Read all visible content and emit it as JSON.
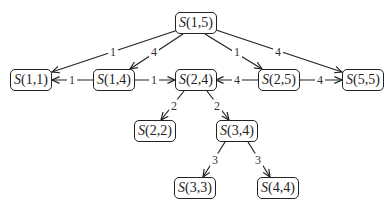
{
  "diagram": {
    "type": "tree",
    "nodes": [
      {
        "id": "S15",
        "fn": "S",
        "args": "(1,5)",
        "x": 175,
        "y": 12,
        "w": 39
      },
      {
        "id": "S11",
        "fn": "S",
        "args": "(1,1)",
        "x": 10,
        "y": 69,
        "w": 41
      },
      {
        "id": "S14",
        "fn": "S",
        "args": "(1,4)",
        "x": 93,
        "y": 69,
        "w": 41
      },
      {
        "id": "S24",
        "fn": "S",
        "args": "(2,4)",
        "x": 175,
        "y": 69,
        "w": 40
      },
      {
        "id": "S25",
        "fn": "S",
        "args": "(2,5)",
        "x": 258,
        "y": 69,
        "w": 41
      },
      {
        "id": "S55",
        "fn": "S",
        "args": "(5,5)",
        "x": 342,
        "y": 69,
        "w": 41
      },
      {
        "id": "S22",
        "fn": "S",
        "args": "(2,2)",
        "x": 134,
        "y": 120,
        "w": 41
      },
      {
        "id": "S34",
        "fn": "S",
        "args": "(3,4)",
        "x": 216,
        "y": 120,
        "w": 41
      },
      {
        "id": "S33",
        "fn": "S",
        "args": "(3,3)",
        "x": 174,
        "y": 177,
        "w": 41
      },
      {
        "id": "S44",
        "fn": "S",
        "args": "(4,4)",
        "x": 257,
        "y": 177,
        "w": 41
      }
    ],
    "edges": [
      {
        "from": "S15",
        "to": "S11",
        "label": "1",
        "x1": 178,
        "y1": 30,
        "x2": 52,
        "y2": 72,
        "lx": 113,
        "ly": 52
      },
      {
        "from": "S15",
        "to": "S14",
        "label": "4",
        "x1": 183,
        "y1": 34,
        "x2": 130,
        "y2": 69,
        "lx": 154,
        "ly": 52
      },
      {
        "from": "S15",
        "to": "S25",
        "label": "1",
        "x1": 205,
        "y1": 34,
        "x2": 262,
        "y2": 69,
        "lx": 237,
        "ly": 52
      },
      {
        "from": "S15",
        "to": "S55",
        "label": "4",
        "x1": 213,
        "y1": 29,
        "x2": 342,
        "y2": 72,
        "lx": 278,
        "ly": 52
      },
      {
        "from": "S14",
        "to": "S11",
        "label": "1",
        "x1": 93,
        "y1": 80,
        "x2": 52,
        "y2": 80,
        "lx": 72,
        "ly": 80
      },
      {
        "from": "S14",
        "to": "S24",
        "label": "1",
        "x1": 134,
        "y1": 80,
        "x2": 175,
        "y2": 80,
        "lx": 154,
        "ly": 80
      },
      {
        "from": "S25",
        "to": "S24",
        "label": "4",
        "x1": 258,
        "y1": 80,
        "x2": 216,
        "y2": 80,
        "lx": 237,
        "ly": 80
      },
      {
        "from": "S25",
        "to": "S55",
        "label": "4",
        "x1": 299,
        "y1": 80,
        "x2": 342,
        "y2": 80,
        "lx": 320,
        "ly": 80
      },
      {
        "from": "S24",
        "to": "S22",
        "label": "2",
        "x1": 184,
        "y1": 91,
        "x2": 161,
        "y2": 120,
        "lx": 174,
        "ly": 106
      },
      {
        "from": "S24",
        "to": "S34",
        "label": "2",
        "x1": 207,
        "y1": 91,
        "x2": 229,
        "y2": 120,
        "lx": 217,
        "ly": 106
      },
      {
        "from": "S34",
        "to": "S33",
        "label": "3",
        "x1": 225,
        "y1": 142,
        "x2": 203,
        "y2": 177,
        "lx": 215,
        "ly": 160
      },
      {
        "from": "S34",
        "to": "S44",
        "label": "3",
        "x1": 248,
        "y1": 142,
        "x2": 270,
        "y2": 177,
        "lx": 258,
        "ly": 160
      }
    ],
    "colors": {
      "stroke": "#222222",
      "text": "#222222",
      "background": "#ffffff"
    }
  }
}
